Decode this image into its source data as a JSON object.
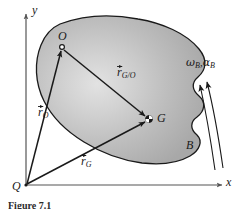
{
  "figure": {
    "kind": "rigid-body-kinematics-diagram",
    "caption": "Figure 7.1",
    "background_color": "#ffffff",
    "body_fill_color": "#b3b3b3",
    "body_highlight_color": "#dcdcdc",
    "body_outline_color": "#1a1a1a",
    "vector_color": "#1a1a1a",
    "axis_color": "#555555"
  },
  "axes": {
    "y_label": "y",
    "x_label": "x",
    "origin_label": "Q"
  },
  "points": [
    {
      "id": "O",
      "label": "O",
      "marker": "open-circle",
      "x": 62,
      "y": 46
    },
    {
      "id": "G",
      "label": "G",
      "marker": "center-of-mass",
      "x": 149,
      "y": 119
    },
    {
      "id": "Q",
      "label": "Q",
      "marker": "origin",
      "x": 25,
      "y": 185
    }
  ],
  "vectors": [
    {
      "id": "r_O",
      "label_base": "r",
      "label_sub": "O",
      "has_overbar": true,
      "from": "Q",
      "to": "O",
      "label_text": "r_O"
    },
    {
      "id": "r_G",
      "label_base": "r",
      "label_sub": "G",
      "has_overbar": true,
      "from": "Q",
      "to": "G",
      "label_text": "r_G"
    },
    {
      "id": "r_G_O",
      "label_base": "r",
      "label_sub": "G/O",
      "has_overbar": true,
      "from": "O",
      "to": "G",
      "label_text": "r_G/O"
    }
  ],
  "body": {
    "label": "B",
    "name": "rigid-body-B"
  },
  "rotation": {
    "omega_symbol": "ω",
    "omega_sub": "B",
    "separator": ",",
    "alpha_symbol": "α",
    "alpha_sub": "B",
    "label_text": "ω_B , α_B",
    "arrow_count": 2,
    "arrow_direction": "counterclockwise-up"
  }
}
